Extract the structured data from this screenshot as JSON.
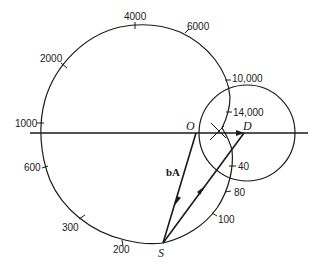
{
  "diagram": {
    "points": {
      "O": "O",
      "D": "D",
      "S": "S"
    },
    "vector_label": "bA",
    "frequency_labels": [
      "40",
      "80",
      "100",
      "200",
      "300",
      "600",
      "1000",
      "2000",
      "4000",
      "6000",
      "10,000",
      "14,000"
    ],
    "ink_color": "#1a1a1a"
  }
}
